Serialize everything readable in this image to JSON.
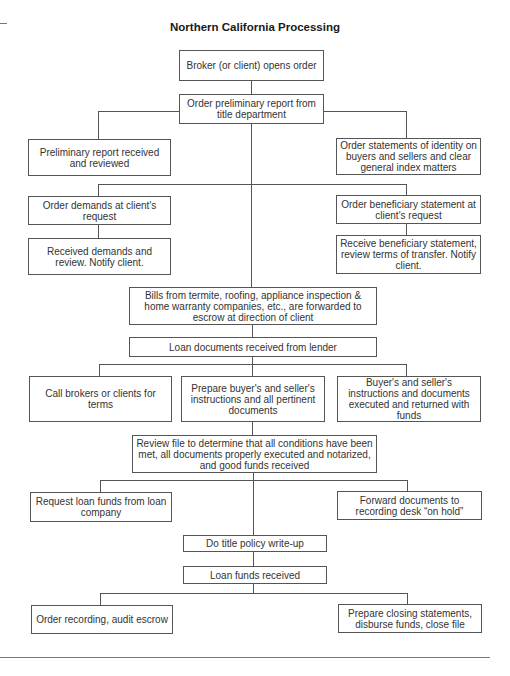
{
  "title": "Northern California Processing",
  "nodes": {
    "broker_opens": "Broker (or client) opens order",
    "order_prelim": "Order preliminary report from title department",
    "prelim_received": "Preliminary report received and reviewed",
    "order_statements_identity": "Order statements of identity on buyers and sellers and clear general index matters",
    "order_demands": "Order demands at client's request",
    "received_demands": "Received demands and review. Notify client.",
    "order_beneficiary": "Order beneficiary statement at client's request",
    "receive_beneficiary": "Receive beneficiary statement, review terms of transfer. Notify client.",
    "bills": "Bills from termite, roofing, appliance inspection & home warranty companies, etc., are forwarded to escrow at direction of client",
    "loan_docs_received": "Loan documents received from lender",
    "call_brokers": "Call brokers or clients for terms",
    "prepare_instructions": "Prepare buyer's and seller's instructions and all pertinent documents",
    "instructions_executed": "Buyer's and seller's instructions and documents executed and returned with funds",
    "review_file": "Review file to determine that all conditions have been met, all documents properly executed and notarized, and good funds received",
    "request_loan_funds": "Request loan funds from loan company",
    "forward_documents": "Forward documents to recording desk “on hold”",
    "title_policy": "Do title policy write-up",
    "loan_funds_received": "Loan funds received",
    "order_recording": "Order recording, audit escrow",
    "prepare_closing": "Prepare closing statements, disburse funds, close file"
  },
  "edges": [
    [
      "broker_opens",
      "order_prelim"
    ],
    [
      "order_prelim",
      "prelim_received"
    ],
    [
      "order_prelim",
      "order_statements_identity"
    ],
    [
      "order_prelim",
      "order_demands"
    ],
    [
      "order_prelim",
      "order_beneficiary"
    ],
    [
      "order_demands",
      "received_demands"
    ],
    [
      "order_beneficiary",
      "receive_beneficiary"
    ],
    [
      "order_prelim",
      "bills"
    ],
    [
      "bills",
      "loan_docs_received"
    ],
    [
      "loan_docs_received",
      "call_brokers"
    ],
    [
      "loan_docs_received",
      "prepare_instructions"
    ],
    [
      "loan_docs_received",
      "instructions_executed"
    ],
    [
      "prepare_instructions",
      "review_file"
    ],
    [
      "review_file",
      "request_loan_funds"
    ],
    [
      "review_file",
      "forward_documents"
    ],
    [
      "review_file",
      "title_policy"
    ],
    [
      "title_policy",
      "loan_funds_received"
    ],
    [
      "loan_funds_received",
      "order_recording"
    ],
    [
      "loan_funds_received",
      "prepare_closing"
    ]
  ]
}
